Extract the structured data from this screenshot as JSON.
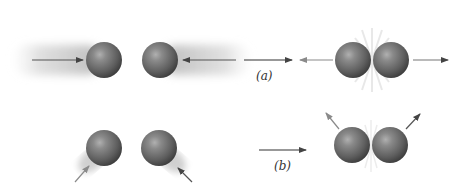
{
  "diagram": {
    "type": "collision-diagram",
    "panels": [
      {
        "id": "a",
        "label": "(a)",
        "description": "Head-on collision: two spheres approach along a line, collide, then separate along the same line",
        "before": {
          "spheres": 2,
          "arrows": [
            "right",
            "left"
          ]
        },
        "after": {
          "spheres": 2,
          "arrows": [
            "left",
            "right"
          ],
          "contact_flash": true
        }
      },
      {
        "id": "b",
        "label": "(b)",
        "description": "Oblique collision: two spheres approach at angles from below, collide, then separate at angles upward",
        "before": {
          "spheres": 2,
          "arrows": [
            "up-right",
            "up-left"
          ]
        },
        "after": {
          "spheres": 2,
          "arrows": [
            "up-left",
            "up-right"
          ],
          "contact_flash": true
        }
      }
    ],
    "transition_arrows": [
      "a-to-after",
      "b-to-after"
    ]
  },
  "colors": {
    "sphere": "#6e6e6e",
    "sphere_highlight": "#a8a8a8",
    "sphere_shadow": "#3a3a3a",
    "arrow_dark": "#444444",
    "arrow_light": "#8a8a8a",
    "trail": "#d6d6d6"
  }
}
